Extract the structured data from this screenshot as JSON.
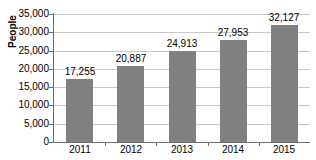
{
  "chart_data": {
    "type": "bar",
    "title": "",
    "xlabel": "",
    "ylabel": "People",
    "categories": [
      "2011",
      "2012",
      "2013",
      "2014",
      "2015"
    ],
    "values": [
      17255,
      20887,
      24913,
      27953,
      32127
    ],
    "value_labels": [
      "17,255",
      "20,887",
      "24,913",
      "27,953",
      "32,127"
    ],
    "ylim": [
      0,
      35000
    ],
    "ytick_values": [
      0,
      5000,
      10000,
      15000,
      20000,
      25000,
      30000,
      35000
    ],
    "ytick_labels": [
      "0",
      "5,000",
      "10,000",
      "15,000",
      "20,000",
      "25,000",
      "30,000",
      "35,000"
    ],
    "grid": true,
    "legend": null,
    "bar_color": "#808080",
    "grid_color": "#c9c9c9",
    "axis_color": "#6e6e6e",
    "background": "#ffffff"
  }
}
